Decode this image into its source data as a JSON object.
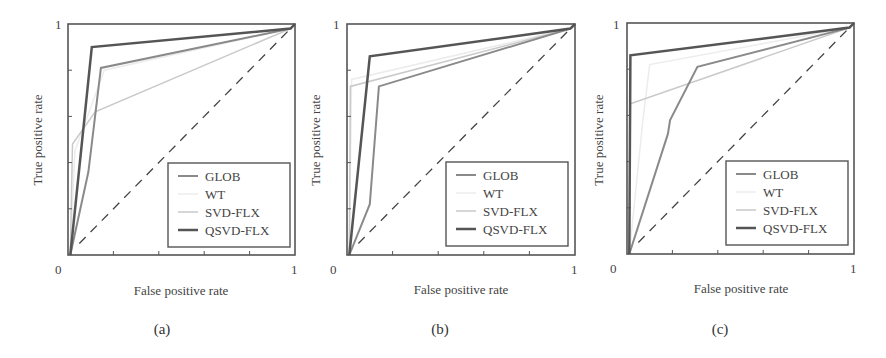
{
  "chart_data": [
    {
      "type": "line",
      "panel": "(a)",
      "xlabel": "False positive rate",
      "ylabel": "True positive rate",
      "xlim": [
        0,
        1
      ],
      "ylim": [
        0,
        1
      ],
      "x_ticks": [
        "0",
        "1"
      ],
      "y_ticks": [
        "1"
      ],
      "grid": false,
      "legend_position": "lower right",
      "reference_line": {
        "style": "dashed",
        "points": [
          [
            0.05,
            0.05
          ],
          [
            0.98,
            0.98
          ]
        ]
      },
      "series": [
        {
          "name": "GLOB",
          "color": "#8a8a8a",
          "width": 2,
          "points": [
            [
              0.01,
              0
            ],
            [
              0.09,
              0.36
            ],
            [
              0.145,
              0.81
            ],
            [
              0.98,
              0.98
            ],
            [
              1,
              1
            ]
          ]
        },
        {
          "name": "WT",
          "color": "#ececec",
          "width": 1.5,
          "points": [
            [
              0.01,
              0
            ],
            [
              0.03,
              0.45
            ],
            [
              0.16,
              0.8
            ],
            [
              0.98,
              0.98
            ],
            [
              1,
              1
            ]
          ]
        },
        {
          "name": "SVD-FLX",
          "color": "#c9c9c9",
          "width": 1.5,
          "points": [
            [
              0.01,
              0
            ],
            [
              0.02,
              0.48
            ],
            [
              0.12,
              0.62
            ],
            [
              0.98,
              0.98
            ],
            [
              1,
              1
            ]
          ]
        },
        {
          "name": "QSVD-FLX",
          "color": "#555555",
          "width": 2.5,
          "points": [
            [
              0.01,
              0
            ],
            [
              0.105,
              0.9
            ],
            [
              0.98,
              0.98
            ],
            [
              1,
              1
            ]
          ]
        }
      ]
    },
    {
      "type": "line",
      "panel": "(b)",
      "xlabel": "False positive rate",
      "ylabel": "True positive rate",
      "xlim": [
        0,
        1
      ],
      "ylim": [
        0,
        1
      ],
      "x_ticks": [
        "0",
        "1"
      ],
      "y_ticks": [
        "1"
      ],
      "grid": false,
      "legend_position": "lower right",
      "reference_line": {
        "style": "dashed",
        "points": [
          [
            0.05,
            0.05
          ],
          [
            0.98,
            0.98
          ]
        ]
      },
      "series": [
        {
          "name": "GLOB",
          "color": "#8a8a8a",
          "width": 2,
          "points": [
            [
              0.01,
              0
            ],
            [
              0.1,
              0.22
            ],
            [
              0.14,
              0.73
            ],
            [
              0.98,
              0.98
            ],
            [
              1,
              1
            ]
          ]
        },
        {
          "name": "WT",
          "color": "#ececec",
          "width": 1.5,
          "points": [
            [
              0.01,
              0
            ],
            [
              0.02,
              0.76
            ],
            [
              0.98,
              0.98
            ],
            [
              1,
              1
            ]
          ]
        },
        {
          "name": "SVD-FLX",
          "color": "#c9c9c9",
          "width": 1.5,
          "points": [
            [
              0.01,
              0
            ],
            [
              0.015,
              0.73
            ],
            [
              0.98,
              0.98
            ],
            [
              1,
              1
            ]
          ]
        },
        {
          "name": "QSVD-FLX",
          "color": "#555555",
          "width": 2.5,
          "points": [
            [
              0.01,
              0
            ],
            [
              0.1,
              0.86
            ],
            [
              0.98,
              0.98
            ],
            [
              1,
              1
            ]
          ]
        }
      ]
    },
    {
      "type": "line",
      "panel": "(c)",
      "xlabel": "False positive rate",
      "ylabel": "True positive rate",
      "xlim": [
        0,
        1
      ],
      "ylim": [
        0,
        1
      ],
      "x_ticks": [
        "0",
        "1"
      ],
      "y_ticks": [
        "1"
      ],
      "grid": false,
      "legend_position": "lower right",
      "reference_line": {
        "style": "dashed",
        "points": [
          [
            0.05,
            0.05
          ],
          [
            0.98,
            0.98
          ]
        ]
      },
      "series": [
        {
          "name": "GLOB",
          "color": "#8a8a8a",
          "width": 2,
          "points": [
            [
              0.01,
              0
            ],
            [
              0.18,
              0.52
            ],
            [
              0.19,
              0.58
            ],
            [
              0.31,
              0.81
            ],
            [
              0.98,
              0.98
            ],
            [
              1,
              1
            ]
          ]
        },
        {
          "name": "WT",
          "color": "#ececec",
          "width": 1.5,
          "points": [
            [
              0.01,
              0
            ],
            [
              0.07,
              0.58
            ],
            [
              0.1,
              0.82
            ],
            [
              0.98,
              0.98
            ],
            [
              1,
              1
            ]
          ]
        },
        {
          "name": "SVD-FLX",
          "color": "#c9c9c9",
          "width": 1.5,
          "points": [
            [
              0.01,
              0
            ],
            [
              0.015,
              0.65
            ],
            [
              0.98,
              0.98
            ],
            [
              1,
              1
            ]
          ]
        },
        {
          "name": "QSVD-FLX",
          "color": "#555555",
          "width": 2.5,
          "points": [
            [
              0.01,
              0
            ],
            [
              0.015,
              0.86
            ],
            [
              0.98,
              0.98
            ],
            [
              1,
              1
            ]
          ]
        }
      ]
    }
  ],
  "panels": [
    {
      "caption": "(a)",
      "xlabel": "False positive rate",
      "ylabel": "True positive rate",
      "x0": "0",
      "x1": "1",
      "y1": "1",
      "legend": [
        "GLOB",
        "WT",
        "SVD-FLX",
        "QSVD-FLX"
      ]
    },
    {
      "caption": "(b)",
      "xlabel": "False positive rate",
      "ylabel": "True positive rate",
      "x0": "0",
      "x1": "1",
      "y1": "1",
      "legend": [
        "GLOB",
        "WT",
        "SVD-FLX",
        "QSVD-FLX"
      ]
    },
    {
      "caption": "(c)",
      "xlabel": "False positive rate",
      "ylabel": "True positive rate",
      "x0": "0",
      "x1": "1",
      "y1": "1",
      "legend": [
        "GLOB",
        "WT",
        "SVD-FLX",
        "QSVD-FLX"
      ]
    }
  ],
  "colors": {
    "axis": "#555555",
    "diagonal": "#444444",
    "legend_border": "#555555"
  }
}
